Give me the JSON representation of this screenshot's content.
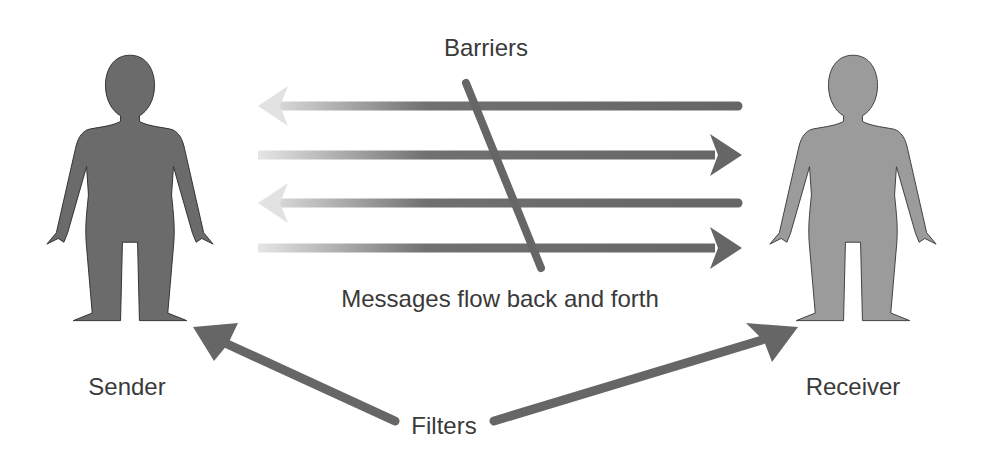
{
  "labels": {
    "barriers": "Barriers",
    "messages": "Messages flow back and forth",
    "sender": "Sender",
    "receiver": "Receiver",
    "filters": "Filters"
  },
  "colors": {
    "sender_figure": "#6b6b6b",
    "receiver_figure": "#9b9b9b",
    "arrow": "#666666",
    "arrow_fade": "#dcdcdc",
    "text": "#3a3a3a"
  },
  "arrows": [
    {
      "direction": "left",
      "y": 106
    },
    {
      "direction": "right",
      "y": 155
    },
    {
      "direction": "left",
      "y": 203
    },
    {
      "direction": "right",
      "y": 248
    }
  ]
}
